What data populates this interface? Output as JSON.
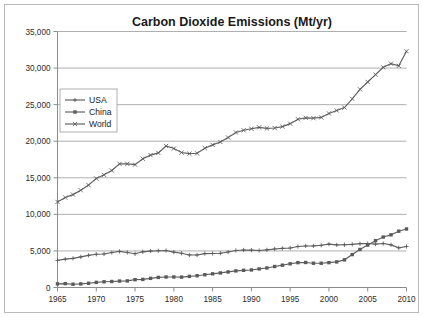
{
  "chart_data": {
    "type": "line",
    "title": "Carbon Dioxide Emissions (Mt/yr)",
    "xlabel": "",
    "ylabel": "",
    "xlim": [
      1965,
      2010
    ],
    "ylim": [
      0,
      35000
    ],
    "grid": true,
    "legend_position": "upper-left-inside",
    "xticks": [
      "1965",
      "1970",
      "1975",
      "1980",
      "1985",
      "1990",
      "1995",
      "2000",
      "2005",
      "2010"
    ],
    "yticks": [
      "0",
      "5,000",
      "10,000",
      "15,000",
      "20,000",
      "25,000",
      "30,000",
      "35,000"
    ],
    "x": [
      1965,
      1966,
      1967,
      1968,
      1969,
      1970,
      1971,
      1972,
      1973,
      1974,
      1975,
      1976,
      1977,
      1978,
      1979,
      1980,
      1981,
      1982,
      1983,
      1984,
      1985,
      1986,
      1987,
      1988,
      1989,
      1990,
      1991,
      1992,
      1993,
      1994,
      1995,
      1996,
      1997,
      1998,
      1999,
      2000,
      2001,
      2002,
      2003,
      2004,
      2005,
      2006,
      2007,
      2008,
      2009,
      2010
    ],
    "series": [
      {
        "name": "USA",
        "marker": "plus",
        "values": [
          3700,
          3880,
          3980,
          4180,
          4400,
          4550,
          4580,
          4780,
          4930,
          4790,
          4610,
          4880,
          4980,
          5020,
          5050,
          4830,
          4680,
          4450,
          4440,
          4640,
          4650,
          4680,
          4850,
          5060,
          5130,
          5110,
          5060,
          5150,
          5270,
          5350,
          5400,
          5600,
          5680,
          5690,
          5770,
          5930,
          5830,
          5840,
          5900,
          5990,
          6010,
          5930,
          6020,
          5830,
          5420,
          5610
        ]
      },
      {
        "name": "China",
        "marker": "square",
        "values": [
          500,
          530,
          450,
          490,
          580,
          700,
          780,
          820,
          880,
          900,
          1070,
          1110,
          1250,
          1380,
          1440,
          1440,
          1420,
          1520,
          1610,
          1750,
          1870,
          1990,
          2130,
          2270,
          2350,
          2400,
          2540,
          2670,
          2870,
          3050,
          3240,
          3400,
          3420,
          3320,
          3320,
          3400,
          3500,
          3780,
          4500,
          5200,
          5800,
          6400,
          6900,
          7200,
          7700,
          8000
        ]
      },
      {
        "name": "World",
        "marker": "x",
        "values": [
          11700,
          12300,
          12700,
          13300,
          14000,
          14900,
          15400,
          16000,
          16900,
          16900,
          16800,
          17600,
          18100,
          18400,
          19350,
          19000,
          18450,
          18300,
          18350,
          19050,
          19500,
          19900,
          20500,
          21200,
          21500,
          21700,
          21900,
          21750,
          21800,
          22000,
          22400,
          23000,
          23200,
          23150,
          23250,
          23800,
          24200,
          24600,
          25800,
          27100,
          28100,
          29100,
          30100,
          30600,
          30300,
          32300
        ]
      }
    ]
  },
  "legend": {
    "items": [
      {
        "label": "USA"
      },
      {
        "label": "China"
      },
      {
        "label": "World"
      }
    ]
  },
  "colors": {
    "series_stroke": "#5f5f5f",
    "gridline": "#9a9a9a",
    "axis": "#8c8c8c",
    "text": "#1a1a1a",
    "frame": "#b9b9b9"
  }
}
